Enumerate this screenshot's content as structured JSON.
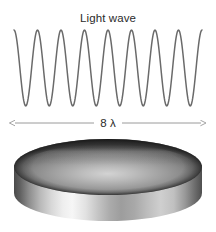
{
  "figure": {
    "title": "Light wave",
    "background_color": "#ffffff",
    "width": 216,
    "height": 232
  },
  "wave": {
    "label": "Light wave",
    "cycles": 8,
    "stroke_color": "#6a6a6a",
    "stroke_width": 1.5
  },
  "dimension": {
    "label": "8 λ",
    "value": 8,
    "unit": "λ",
    "arrow_color": "#9a9a9a",
    "style": "double-headed"
  },
  "disk": {
    "name": "metallic disk",
    "top_face_color": "#8a8a8a",
    "side_band_color": "#c9c9c9",
    "rim_color": "#3f3f3f",
    "highlight_color": "#f6f6f6"
  },
  "chart_data": {
    "type": "line",
    "title": "Light wave",
    "xlabel": "",
    "ylabel": "",
    "annotations": [
      "Light wave",
      "8 λ"
    ],
    "series": [
      {
        "name": "Light wave",
        "waveform": "sine",
        "cycles": 8,
        "amplitude": 1,
        "x_start": 14,
        "x_end": 202,
        "color": "#6a6a6a"
      }
    ],
    "legend_position": "none",
    "grid": false
  }
}
